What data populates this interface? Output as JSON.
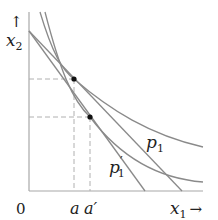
{
  "diagram": {
    "type": "indifference-curves-budget-lines",
    "axes": {
      "origin_label": "0",
      "x_label": "x",
      "x_sub": "1",
      "x_arrow": "→",
      "y_label": "x",
      "y_sub": "2",
      "y_arrow": "↑"
    },
    "tick_labels": {
      "a": "a",
      "a_prime": "a′"
    },
    "budget_lines": [
      {
        "name": "p1",
        "label": "p",
        "sub": "1",
        "prime": ""
      },
      {
        "name": "p1_prime",
        "label": "p",
        "sub": "1",
        "prime": "′"
      }
    ],
    "colors": {
      "axis": "#a0a0a0",
      "curve": "#808080",
      "dash": "#b0b0b0",
      "point": "#111111",
      "text": "#222222"
    }
  }
}
